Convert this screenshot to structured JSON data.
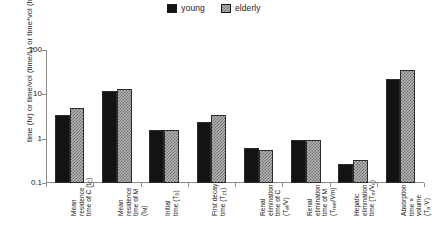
{
  "chart_data": {
    "type": "bar",
    "title": "",
    "xlabel": "",
    "ylabel": "time (hr) or time/vol (time/L) or time*vol (hr·L)",
    "yscale": "log",
    "ylim": [
      0.1,
      100
    ],
    "ytick_labels": [
      "100",
      "10",
      "1",
      "0.1"
    ],
    "ytick_values": [
      100,
      10,
      1,
      0.1
    ],
    "grid": false,
    "legend_position": "top-center",
    "categories": [
      "Mean residence time of C (tC)",
      "Mean residence time of M (tM)",
      "Initial time (T0)",
      "First decay time (Tz1)",
      "Renal elimination time of C (Tel/V)",
      "Renal elimination time of M (Tmel/Vm)",
      "Hepatic elimination time (Tm/Vc)",
      "Absorption time × volume (Ta·V)"
    ],
    "series": [
      {
        "name": "young",
        "values": [
          3.5,
          12.0,
          1.6,
          2.4,
          0.62,
          0.92,
          0.27,
          22.0
        ]
      },
      {
        "name": "elderly",
        "values": [
          4.9,
          13.0,
          1.6,
          3.5,
          0.57,
          0.92,
          0.33,
          35.0
        ]
      }
    ]
  },
  "legend": {
    "entries": [
      {
        "label": "young",
        "swatch": "solid-black-square-icon"
      },
      {
        "label": "elderly",
        "swatch": "checkered-gray-square-icon"
      }
    ]
  },
  "axes": {
    "y_title_parts": {
      "full": "time (hr) or time/vol (time/L) or time*vol (hr·L)"
    }
  },
  "x_labels": [
    {
      "line1": "Mean",
      "line2": "residence",
      "line3": "time of C (t",
      "sub3": "C",
      "tail3": ")"
    },
    {
      "line1": "Mean",
      "line2": "residence",
      "line3": "time of M",
      "line4": "(t",
      "sub4": "M",
      "tail4": ")"
    },
    {
      "line1": "Initial",
      "line2": "time (T",
      "sub2": "0",
      "tail2": ")"
    },
    {
      "line1": "First decay",
      "line2": "time (T",
      "sub2": "z1",
      "tail2": ")"
    },
    {
      "line1": "Renal",
      "line2": "elimination",
      "line3": "time of C",
      "line4": "(T",
      "sub4": "el",
      "tail4": "/V)"
    },
    {
      "line1": "Renal",
      "line2": "elimination",
      "line3": "time of M",
      "line4": "(T",
      "sub4": "mel",
      "tail4": "/Vm)"
    },
    {
      "line1": "Hepatic",
      "line2": "elimination",
      "line3": "time (T",
      "sub3": "m",
      "tail3": "/V",
      "sub3b": "c",
      "tail3b": ")"
    },
    {
      "line1": "Absorption",
      "line2": "time ×",
      "line3": "volume",
      "line4": "(T",
      "sub4": "a",
      "tail4": "·V)"
    }
  ]
}
